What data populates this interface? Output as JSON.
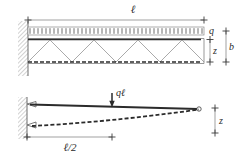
{
  "figure": {
    "type": "engineering-diagram",
    "colors": {
      "ink": "#2b2b2b",
      "thin": "#7a7a7a",
      "hatch": "#9a9a9a",
      "background": "#ffffff"
    }
  },
  "upper_diagram": {
    "name": "truss-cantilever",
    "span_label": "ℓ",
    "load_label": "q",
    "depth_label": "z",
    "band_label": "b",
    "support": "fixed-wall-hatched",
    "truss_apex_count": 4,
    "top_chord": "solid-bold",
    "bottom_chord": "dashed-bold",
    "web_members": "zigzag-diagonal-thin",
    "load_type": "uniformly-distributed",
    "load_tick_count": 44
  },
  "lower_diagram": {
    "name": "beam-deflection",
    "load_label": "qℓ",
    "half_span_label": "ℓ/2",
    "deflection_label": "z",
    "support": "fixed-wall-hatched-two-pin",
    "beam_line": "solid-bold",
    "deflection_curve": "dashed-bold",
    "load_type": "point-load-downward",
    "pin_count": 2
  }
}
